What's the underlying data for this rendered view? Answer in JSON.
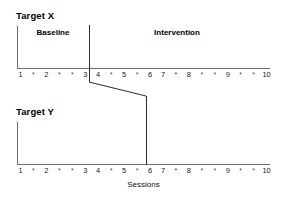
{
  "figure": {
    "x_axis_caption": "Sessions"
  },
  "panels": [
    {
      "title": "Target X",
      "phase_labels": {
        "baseline": "Baseline",
        "intervention": "Intervention"
      },
      "ticks": [
        "1",
        "*",
        "2",
        "*",
        "*",
        "3",
        "4",
        "*",
        "5",
        "*",
        "6",
        "7",
        "*",
        "8",
        "*",
        "*",
        "9",
        "*",
        "*",
        "10"
      ],
      "phase_change_after_tick_index": 5
    },
    {
      "title": "Target Y",
      "ticks": [
        "1",
        "*",
        "2",
        "*",
        "*",
        "3",
        "4",
        "*",
        "5",
        "*",
        "6",
        "7",
        "*",
        "8",
        "*",
        "*",
        "9",
        "*",
        "*",
        "10"
      ],
      "phase_change_after_tick_index": 9
    }
  ],
  "chart_data": {
    "type": "line",
    "title": "",
    "xlabel": "Sessions",
    "ylabel": "",
    "grid": false,
    "legend": "none",
    "x_tick_labels": [
      "1",
      "*",
      "2",
      "*",
      "*",
      "3",
      "4",
      "*",
      "5",
      "*",
      "6",
      "7",
      "*",
      "8",
      "*",
      "*",
      "9",
      "*",
      "*",
      "10"
    ],
    "x_numeric_sessions": [
      1,
      2,
      3,
      4,
      5,
      6,
      7,
      8,
      9,
      10
    ],
    "panels": [
      {
        "name": "Target X",
        "phases": [
          {
            "name": "Baseline",
            "start_tick": 1,
            "end_tick": 6
          },
          {
            "name": "Intervention",
            "start_tick": 7,
            "end_tick": 20
          }
        ],
        "phase_line_at_tick": 6,
        "series": []
      },
      {
        "name": "Target Y",
        "phases": [
          {
            "name": "Baseline",
            "start_tick": 1,
            "end_tick": 10
          },
          {
            "name": "Intervention",
            "start_tick": 11,
            "end_tick": 20
          }
        ],
        "phase_line_at_tick": 10,
        "series": []
      }
    ],
    "colors": {
      "axis": "#6e6e6e",
      "phase_line": "#2b2b2b",
      "text": "#000000"
    }
  },
  "connector": {
    "from_x": 89,
    "from_y": 82,
    "to_x": 146,
    "to_y": 96
  }
}
